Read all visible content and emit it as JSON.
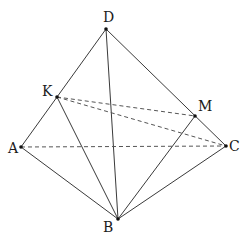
{
  "diagram": {
    "type": "tetrahedron",
    "points": {
      "D": {
        "x": 106,
        "y": 29,
        "label": "D",
        "lx": 103,
        "ly": 22
      },
      "K": {
        "x": 57,
        "y": 97,
        "label": "K",
        "lx": 42,
        "ly": 96
      },
      "M": {
        "x": 195,
        "y": 116,
        "label": "M",
        "lx": 198,
        "ly": 111
      },
      "A": {
        "x": 21,
        "y": 147,
        "label": "A",
        "lx": 8,
        "ly": 153
      },
      "C": {
        "x": 226,
        "y": 146,
        "label": "C",
        "lx": 229,
        "ly": 151
      },
      "B": {
        "x": 118,
        "y": 219,
        "label": "B",
        "lx": 103,
        "ly": 232
      }
    },
    "solid_edges": [
      [
        "D",
        "A"
      ],
      [
        "D",
        "B"
      ],
      [
        "D",
        "C"
      ],
      [
        "A",
        "B"
      ],
      [
        "B",
        "C"
      ],
      [
        "K",
        "B"
      ],
      [
        "M",
        "B"
      ]
    ],
    "dashed_edges": [
      [
        "K",
        "M"
      ],
      [
        "K",
        "C"
      ],
      [
        "A",
        "C"
      ]
    ]
  }
}
